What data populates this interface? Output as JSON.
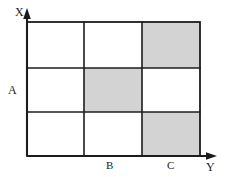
{
  "figure": {
    "background_color": "#ffffff",
    "line_color": "#1c1c1c",
    "shade_color": "#d3d3d3"
  },
  "axes": {
    "vertical": {
      "name": "vertical-axis",
      "label": "X",
      "arrow": "up-arrow",
      "x": 27,
      "y_top": 11,
      "y_bottom": 156
    },
    "horizontal": {
      "name": "horizontal-axis",
      "label": "Y",
      "arrow": "right-arrow",
      "y": 156,
      "x_left": 27,
      "x_right": 216
    }
  },
  "labels": {
    "x_axis": "X",
    "y_axis": "Y",
    "row_marker": "A",
    "column_marker_1": "B",
    "column_marker_2": "C"
  },
  "grid": {
    "left": 27,
    "right": 200,
    "top": 22,
    "bottom": 156,
    "columns": 3,
    "rows": 3,
    "column_edges": [
      27,
      84,
      142,
      200
    ],
    "row_edges": [
      22,
      68,
      112,
      156
    ],
    "cells": [
      [
        {
          "row": 1,
          "col": 1,
          "shaded": false
        },
        {
          "row": 1,
          "col": 2,
          "shaded": false
        },
        {
          "row": 1,
          "col": 3,
          "shaded": true
        }
      ],
      [
        {
          "row": 2,
          "col": 1,
          "shaded": false
        },
        {
          "row": 2,
          "col": 2,
          "shaded": true
        },
        {
          "row": 2,
          "col": 3,
          "shaded": false
        }
      ],
      [
        {
          "row": 3,
          "col": 1,
          "shaded": false
        },
        {
          "row": 3,
          "col": 2,
          "shaded": false
        },
        {
          "row": 3,
          "col": 3,
          "shaded": true
        }
      ]
    ],
    "shaded_cells": [
      {
        "row": 1,
        "col": 3
      },
      {
        "row": 2,
        "col": 2
      },
      {
        "row": 3,
        "col": 3
      }
    ]
  }
}
